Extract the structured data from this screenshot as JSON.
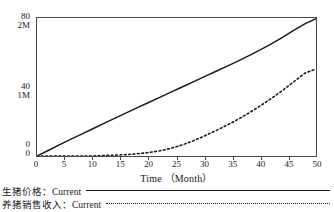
{
  "chart_data": {
    "type": "line",
    "title": "",
    "xlabel": "Time （Month）",
    "ylabel": "",
    "xlim": [
      0,
      50
    ],
    "xticks": [
      0,
      5,
      10,
      15,
      20,
      25,
      30,
      35,
      40,
      45,
      50
    ],
    "xtick_labels": [
      "0",
      "5",
      "10",
      "15",
      "20",
      "25",
      "30",
      "35",
      "40",
      "45",
      "50"
    ],
    "grid": false,
    "legend_position": "below-axes-left",
    "y_axes": [
      {
        "name": "生猪价格",
        "unit": "",
        "lim": [
          0,
          80
        ],
        "ticks": [
          0,
          40,
          80
        ],
        "tick_labels": [
          "0",
          "40",
          "80"
        ]
      },
      {
        "name": "养猪销售收入",
        "unit": "M",
        "lim": [
          0,
          2
        ],
        "ticks": [
          0,
          1,
          2
        ],
        "tick_labels": [
          "0",
          "1M",
          "2M"
        ]
      }
    ],
    "ytick_rows": [
      {
        "position": 80,
        "top_label": "80",
        "bottom_label": "2M"
      },
      {
        "position": 40,
        "top_label": "40",
        "bottom_label": "1M"
      },
      {
        "position": 0,
        "top_label": "0",
        "bottom_label": "0"
      }
    ],
    "series": [
      {
        "name": "生猪价格：Current",
        "label": "生猪价格：Current",
        "style": "solid",
        "color": "#1a1a1a",
        "axis": "left-80",
        "x": [
          0,
          2,
          4,
          6,
          8,
          10,
          12,
          14,
          16,
          18,
          20,
          22,
          24,
          26,
          28,
          30,
          32,
          34,
          36,
          38,
          40,
          42,
          44,
          46,
          48,
          50
        ],
        "values": [
          0.0,
          3.2,
          6.4,
          9.6,
          12.7,
          15.8,
          18.9,
          22.0,
          25.0,
          28.0,
          31.0,
          34.0,
          37.0,
          40.0,
          43.0,
          46.0,
          49.0,
          52.0,
          55.0,
          58.2,
          61.5,
          65.0,
          68.8,
          72.8,
          76.6,
          79.6
        ]
      },
      {
        "name": "养猪销售收入：Current",
        "label": "养猪销售收入：Current",
        "style": "dotted",
        "color": "#1a1a1a",
        "axis": "right-2M",
        "x": [
          0,
          2,
          4,
          6,
          8,
          10,
          12,
          14,
          16,
          18,
          20,
          22,
          24,
          26,
          28,
          30,
          32,
          34,
          36,
          38,
          40,
          42,
          44,
          46,
          48,
          50
        ],
        "values": [
          0.0,
          0.0,
          0.0,
          0.0,
          0.0,
          0.0,
          0.01,
          0.02,
          0.03,
          0.05,
          0.08,
          0.12,
          0.18,
          0.27,
          0.38,
          0.52,
          0.68,
          0.86,
          1.06,
          1.28,
          1.52,
          1.78,
          2.06,
          2.36,
          2.68,
          3.0
        ],
        "values_display_scale": "80-axis",
        "values_on_80_axis": [
          0.0,
          0.0,
          0.0,
          0.0,
          0.0,
          0.0,
          0.3,
          0.5,
          0.8,
          1.3,
          2.0,
          3.0,
          4.4,
          6.4,
          8.8,
          11.6,
          14.6,
          17.8,
          21.2,
          25.0,
          29.0,
          33.4,
          38.0,
          43.0,
          48.0,
          50.5
        ]
      }
    ]
  },
  "legend": {
    "items": [
      {
        "label": "生猪价格：Current",
        "style": "solid"
      },
      {
        "label": "养猪销售收入：Current",
        "style": "dotted"
      }
    ]
  },
  "axis_title": {
    "x": "Time （Month）"
  }
}
